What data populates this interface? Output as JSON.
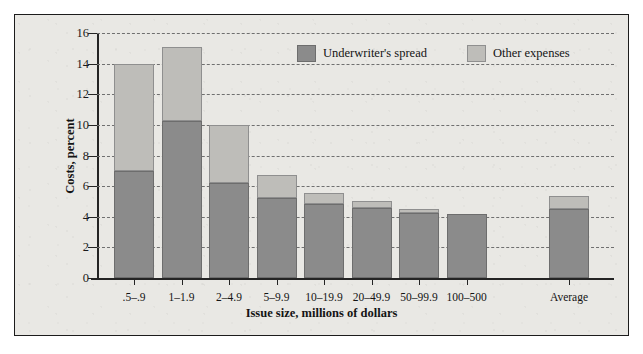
{
  "chart_data": {
    "type": "bar",
    "stacked": true,
    "title": "",
    "xlabel": "Issue size, millions of dollars",
    "ylabel": "Costs, percent",
    "ylim": [
      0,
      16
    ],
    "yticks": [
      0,
      2,
      4,
      6,
      8,
      10,
      12,
      14,
      16
    ],
    "grid": true,
    "legend_position": "top-right",
    "categories": [
      ".5–.9",
      "1–1.9",
      "2–4.9",
      "5–9.9",
      "10–19.9",
      "20–49.9",
      "50–99.9",
      "100–500",
      "Average"
    ],
    "series": [
      {
        "name": "Underwriter's spread",
        "color": "#8b8b8b",
        "values": [
          7.0,
          10.25,
          6.2,
          5.2,
          4.85,
          4.6,
          4.25,
          4.2,
          4.5
        ]
      },
      {
        "name": "Other expenses",
        "color": "#bebdb9",
        "values": [
          7.0,
          4.85,
          3.8,
          1.5,
          0.7,
          0.45,
          0.25,
          0.0,
          0.85
        ]
      }
    ],
    "totals": [
      14.0,
      15.1,
      10.0,
      6.7,
      5.55,
      5.05,
      4.5,
      4.2,
      5.35
    ]
  },
  "legend": {
    "items": [
      {
        "label": "Underwriter's spread",
        "swatch": "dark-gray-swatch"
      },
      {
        "label": "Other expenses",
        "swatch": "light-gray-swatch"
      }
    ]
  },
  "axes": {
    "y_title": "Costs, percent",
    "x_title": "Issue size, millions of dollars",
    "y_tick_labels": [
      "16",
      "14",
      "12",
      "10",
      "8",
      "6",
      "4",
      "2",
      "0"
    ],
    "x_tick_labels": [
      ".5–.9",
      "1–1.9",
      "2–4.9",
      "5–9.9",
      "10–19.9",
      "20–49.9",
      "50–99.9",
      "100–500",
      "Average"
    ]
  },
  "colors": {
    "underwriters_spread": "#8b8b8b",
    "other_expenses": "#bebdb9",
    "background": "#e9e8e4",
    "axis": "#242424",
    "gridline": "#6f6f6f"
  }
}
